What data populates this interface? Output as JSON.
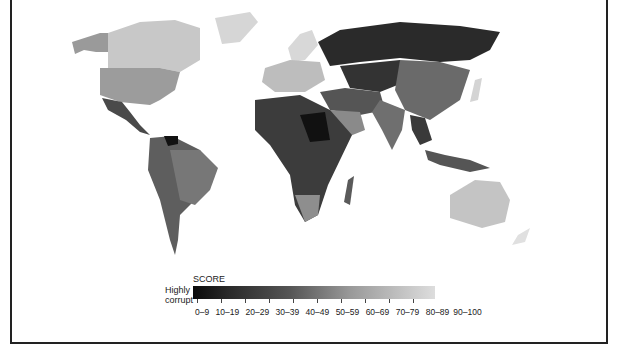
{
  "legend": {
    "title": "SCORE",
    "low_label_line1": "Highly",
    "low_label_line2": "corrupt",
    "ranges": [
      "0–9",
      "10–19",
      "20–29",
      "30–39",
      "40–49",
      "50–59",
      "60–69",
      "70–79",
      "80–89",
      "90–100"
    ],
    "colors": [
      "#0a0a0a",
      "#222222",
      "#383838",
      "#4f4f4f",
      "#666666",
      "#7e7e7e",
      "#979797",
      "#b0b0b0",
      "#c9c9c9",
      "#e0e0e0"
    ]
  },
  "regions": [
    {
      "name": "Alaska",
      "shade": "#9a9a9a"
    },
    {
      "name": "Canada",
      "shade": "#c8c8c8"
    },
    {
      "name": "Greenland",
      "shade": "#d6d6d6"
    },
    {
      "name": "United States",
      "shade": "#9c9c9c"
    },
    {
      "name": "Mexico",
      "shade": "#4a4a4a"
    },
    {
      "name": "South America",
      "shade": "#5e5e5e"
    },
    {
      "name": "Brazil",
      "shade": "#777777"
    },
    {
      "name": "Venezuela",
      "shade": "#111111"
    },
    {
      "name": "Europe West",
      "shade": "#bdbdbd"
    },
    {
      "name": "Scandinavia",
      "shade": "#d8d8d8"
    },
    {
      "name": "Russia",
      "shade": "#2a2a2a"
    },
    {
      "name": "Central Asia",
      "shade": "#333333"
    },
    {
      "name": "China",
      "shade": "#6a6a6a"
    },
    {
      "name": "India",
      "shade": "#6f6f6f"
    },
    {
      "name": "Middle East",
      "shade": "#555555"
    },
    {
      "name": "Saudi Arabia",
      "shade": "#8a8a8a"
    },
    {
      "name": "Africa",
      "shade": "#3c3c3c"
    },
    {
      "name": "Sudan",
      "shade": "#111111"
    },
    {
      "name": "Southern Africa",
      "shade": "#8e8e8e"
    },
    {
      "name": "Australia",
      "shade": "#c4c4c4"
    },
    {
      "name": "Indonesia",
      "shade": "#555555"
    },
    {
      "name": "Japan",
      "shade": "#d4d4d4"
    }
  ]
}
